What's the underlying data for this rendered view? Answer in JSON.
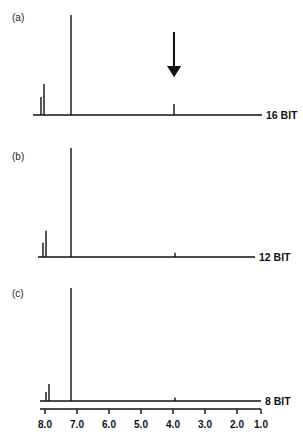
{
  "chart_data": {
    "type": "line",
    "title": "",
    "xlabel": "",
    "ylabel": "",
    "x_axis": {
      "direction": "reversed",
      "range": [
        8.0,
        1.0
      ],
      "ticks": [
        {
          "value": 8.0,
          "label": "8.0",
          "px": 45
        },
        {
          "value": 7.0,
          "label": "7.0",
          "px": 77
        },
        {
          "value": 6.0,
          "label": "6.0",
          "px": 109
        },
        {
          "value": 5.0,
          "label": "5.0",
          "px": 141
        },
        {
          "value": 4.0,
          "label": "4.0",
          "px": 173
        },
        {
          "value": 3.0,
          "label": "3.0",
          "px": 205
        },
        {
          "value": 2.0,
          "label": "2.0",
          "px": 237
        },
        {
          "value": 1.0,
          "label": "1.0",
          "px": 261
        }
      ]
    },
    "grid": false,
    "legend": null,
    "panels": [
      {
        "id": "a",
        "label": "(a)",
        "bit_label": "16 BIT",
        "baseline_y": 115,
        "top_y": 15,
        "baseline_x": [
          33,
          262
        ],
        "label_pos": [
          12,
          21
        ],
        "peaks": [
          {
            "ppm": 8.13,
            "x": 41,
            "relative_height": 0.18
          },
          {
            "ppm": 8.03,
            "x": 44,
            "relative_height": 0.31
          },
          {
            "ppm": 7.19,
            "x": 71,
            "relative_height": 1.0
          },
          {
            "ppm": 3.97,
            "x": 174,
            "relative_height": 0.11
          }
        ],
        "annotation": {
          "type": "arrow",
          "x": 174,
          "y_start": 32,
          "y_end": 77,
          "points_to_ppm": 3.97
        }
      },
      {
        "id": "b",
        "label": "(b)",
        "bit_label": "12 BIT",
        "baseline_y": 257,
        "top_y": 148,
        "baseline_x": [
          38,
          255
        ],
        "label_pos": [
          12,
          160
        ],
        "peaks": [
          {
            "ppm": 8.06,
            "x": 43,
            "relative_height": 0.13
          },
          {
            "ppm": 7.97,
            "x": 46,
            "relative_height": 0.24
          },
          {
            "ppm": 7.19,
            "x": 71,
            "relative_height": 1.0
          },
          {
            "ppm": 3.94,
            "x": 175,
            "relative_height": 0.04
          }
        ]
      },
      {
        "id": "c",
        "label": "(c)",
        "bit_label": "8 BIT",
        "baseline_y": 401,
        "top_y": 288,
        "baseline_x": [
          40,
          261
        ],
        "label_pos": [
          12,
          297
        ],
        "peaks": [
          {
            "ppm": 7.97,
            "x": 46,
            "relative_height": 0.08
          },
          {
            "ppm": 7.88,
            "x": 49,
            "relative_height": 0.15
          },
          {
            "ppm": 7.19,
            "x": 71,
            "relative_height": 1.0
          },
          {
            "ppm": 3.94,
            "x": 175,
            "relative_height": 0.03
          }
        ]
      }
    ],
    "axis_line": {
      "y": 409,
      "x_start": 40,
      "x_end": 261,
      "tick_len": 5,
      "label_y": 428
    }
  }
}
